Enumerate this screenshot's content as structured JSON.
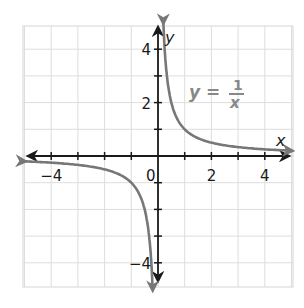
{
  "chart_data": {
    "type": "line",
    "title": "",
    "xlabel": "x",
    "ylabel": "y",
    "xlim": [
      -5,
      5
    ],
    "ylim": [
      -5,
      5
    ],
    "grid": true,
    "x_ticks": [
      -4,
      -3,
      -2,
      -1,
      1,
      2,
      3,
      4
    ],
    "y_ticks": [
      -4,
      -3,
      -2,
      -1,
      1,
      2,
      3,
      4
    ],
    "x_tick_labels": [
      {
        "value": -4,
        "label": "−4"
      },
      {
        "value": 2,
        "label": "2"
      },
      {
        "value": 4,
        "label": "4"
      }
    ],
    "y_tick_labels": [
      {
        "value": 4,
        "label": "4"
      },
      {
        "value": 2,
        "label": "2"
      },
      {
        "value": -4,
        "label": "−4"
      }
    ],
    "origin_label": "0",
    "series": [
      {
        "name": "y = 1/x",
        "function": "1/x",
        "color": "#777777",
        "branches": [
          {
            "x_range": [
              0.2,
              5
            ],
            "points": [
              [
                0.2,
                5
              ],
              [
                0.25,
                4
              ],
              [
                0.33,
                3
              ],
              [
                0.5,
                2
              ],
              [
                1,
                1
              ],
              [
                2,
                0.5
              ],
              [
                3,
                0.33
              ],
              [
                4,
                0.25
              ],
              [
                5,
                0.2
              ]
            ]
          },
          {
            "x_range": [
              -5,
              -0.2
            ],
            "points": [
              [
                -5,
                -0.2
              ],
              [
                -4,
                -0.25
              ],
              [
                -3,
                -0.33
              ],
              [
                -2,
                -0.5
              ],
              [
                -1,
                -1
              ],
              [
                -0.5,
                -2
              ],
              [
                -0.33,
                -3
              ],
              [
                -0.25,
                -4
              ],
              [
                -0.2,
                -5
              ]
            ]
          }
        ]
      }
    ],
    "annotation": {
      "lhs": "y =",
      "numerator": "1",
      "denominator": "x",
      "position": "upper-right of first quadrant"
    },
    "colors": {
      "axis": "#1a1a1a",
      "grid": "#dddddd",
      "curve": "#777777",
      "annotation": "#888888"
    }
  }
}
